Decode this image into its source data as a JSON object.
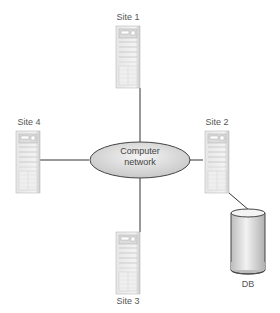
{
  "diagram": {
    "network": {
      "label_line1": "Computer",
      "label_line2": "network"
    },
    "sites": [
      {
        "id": "site1",
        "label": "Site 1",
        "position": "top"
      },
      {
        "id": "site2",
        "label": "Site 2",
        "position": "right"
      },
      {
        "id": "site3",
        "label": "Site 3",
        "position": "bottom"
      },
      {
        "id": "site4",
        "label": "Site 4",
        "position": "left"
      }
    ],
    "database": {
      "label": "DB",
      "connected_to": "Site 2"
    },
    "colors": {
      "line": "#333333",
      "ellipse_fill": "#d8d8d8",
      "server_fill": "#ececec",
      "text": "#555555"
    }
  }
}
